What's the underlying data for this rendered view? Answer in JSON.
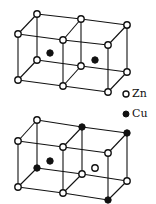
{
  "diagram": {
    "title": "",
    "legend": [
      {
        "label": "Zn",
        "marker": "open-circle",
        "color": "#ffffff"
      },
      {
        "label": "Cu",
        "marker": "filled-circle",
        "color": "#111111"
      }
    ],
    "structures": [
      {
        "name": "ordered-lattice",
        "description": "Two adjacent cubic cells; Zn at all corners, Cu at both body centers",
        "corners_open": 12,
        "body_centers": [
          "Cu",
          "Cu"
        ]
      },
      {
        "name": "disordered-lattice",
        "description": "Two adjacent cubic cells with mixed Cu/Zn occupancy",
        "body_centers": [
          "Cu",
          "Zn"
        ],
        "filled_corners": [
          "back-top-middle",
          "back-top-right",
          "back-bottom-left",
          "front-bottom-right"
        ]
      }
    ]
  }
}
